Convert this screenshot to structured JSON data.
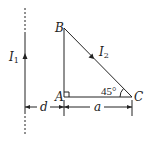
{
  "diagram": {
    "wire": {
      "current_label": "I",
      "current_sub": "1",
      "direction": "up"
    },
    "triangle": {
      "vertices": {
        "B": "B",
        "A": "A",
        "C": "C"
      },
      "hypotenuse_current_label": "I",
      "hypotenuse_current_sub": "2",
      "angle_C": "45°",
      "right_angle_at": "A"
    },
    "dimensions": {
      "wire_to_A": "d",
      "A_to_C": "a"
    },
    "colors": {
      "stroke": "#222222",
      "background": "#ffffff"
    }
  }
}
